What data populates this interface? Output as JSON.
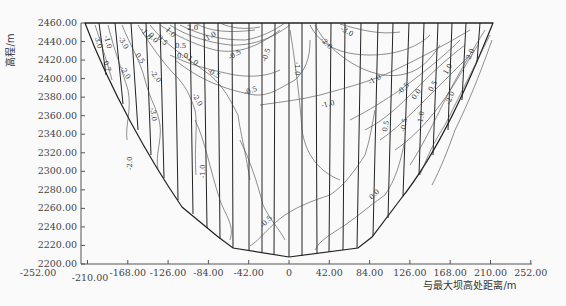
{
  "chart_data": {
    "type": "contour",
    "title": "",
    "xlabel": "与最大坝高处距离/m",
    "ylabel": "高程/m",
    "xlim": [
      -252,
      252
    ],
    "ylim": [
      2200,
      2460
    ],
    "x_ticks": [
      "-252.00",
      "-210.00",
      "-168.00",
      "-126.00",
      "-84.00",
      "-42.00",
      "0",
      "42.00",
      "84.00",
      "126.00",
      "168.00",
      "210.00",
      "252.00"
    ],
    "y_ticks": [
      "2460.00",
      "2440.00",
      "2420.00",
      "2400.00",
      "2380.00",
      "2360.00",
      "2340.00",
      "2320.00",
      "2300.00",
      "2280.00",
      "2260.00",
      "2240.00",
      "2220.00",
      "2200.00"
    ],
    "grid": false,
    "contour_levels": [
      -3.0,
      -2.0,
      -1.0,
      -0.5,
      0.0,
      0.5,
      1.0,
      2.0,
      3.0
    ],
    "contour_labels_visible": [
      "-3.0",
      "-2.0",
      "-1.0",
      "-0.5",
      "0.0",
      "0.5",
      "1.0",
      "2.0",
      "3.0"
    ],
    "dam_outline": {
      "crest_elevation": 2460,
      "crest_x_range": [
        -210,
        214
      ],
      "bottom_elevation": 2213,
      "bottom_x": 0
    }
  },
  "axes": {
    "x_title": "与最大坝高处距离/m",
    "y_title": "高程/m"
  },
  "labels": {
    "l1": "3.0",
    "l2": "-1.0",
    "l3": "0.7",
    "l4": "-3.0",
    "l5": "-2.0",
    "l6": "0.5",
    "l7": "-2.0",
    "l8": "-1.0",
    "l9": "0.0",
    "l10": "0.5",
    "l11": "1.0",
    "l12": "2.0",
    "l13": "-3.0",
    "l14": "-2.0",
    "l15": "-1.0",
    "l16": "0.5",
    "l17": "0.0",
    "l18": "-0.5",
    "l19": "-1.0",
    "l20": "-0.5",
    "l21": "-0.5",
    "l22": "-0.5",
    "l23": "-1.0",
    "l24": "-2.0",
    "l25": "-3.0",
    "l26": "-1.0",
    "l27": "-1.0",
    "l28": "-0.5",
    "l29": "0.0",
    "l30": "0.5",
    "l31": "1.0",
    "l32": "2.0",
    "l33": "-2.0",
    "l34": "-1.0",
    "l35": "-0.5",
    "l36": "0.5",
    "l37": "0.0",
    "l38": "-0.5",
    "l39": "-1.0",
    "l40": "-2.0"
  }
}
